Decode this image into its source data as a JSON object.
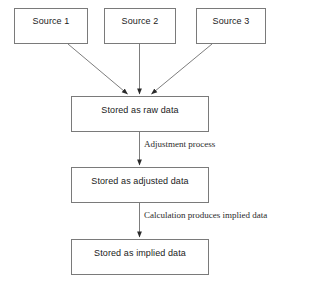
{
  "diagram": {
    "type": "flowchart",
    "background_color": "#ffffff",
    "line_color": "#6e6e6e",
    "text_color": "#1a1a1a",
    "sources": [
      {
        "id": "source-1",
        "label": "Source 1"
      },
      {
        "id": "source-2",
        "label": "Source 2"
      },
      {
        "id": "source-3",
        "label": "Source 3"
      }
    ],
    "stages": [
      {
        "id": "stage-raw",
        "label": "Stored as raw data"
      },
      {
        "id": "stage-adjusted",
        "label": "Stored as adjusted data"
      },
      {
        "id": "stage-implied",
        "label": "Stored as implied data"
      }
    ],
    "edge_labels": [
      {
        "id": "edge-adjustment",
        "label": "Adjustment process"
      },
      {
        "id": "edge-calculation",
        "label": "Calculation produces implied data"
      }
    ],
    "connections": [
      {
        "from": "source-1",
        "to": "stage-raw",
        "style": "diagonal",
        "arrow": true
      },
      {
        "from": "source-2",
        "to": "stage-raw",
        "style": "vertical",
        "arrow": true
      },
      {
        "from": "source-3",
        "to": "stage-raw",
        "style": "diagonal",
        "arrow": true
      },
      {
        "from": "stage-raw",
        "to": "stage-adjusted",
        "style": "vertical",
        "arrow": true,
        "label": "Adjustment process"
      },
      {
        "from": "stage-adjusted",
        "to": "stage-implied",
        "style": "vertical",
        "arrow": true,
        "label": "Calculation produces implied data"
      }
    ]
  }
}
